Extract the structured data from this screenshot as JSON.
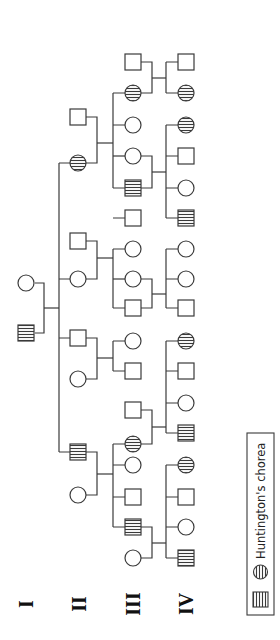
{
  "diagram": {
    "type": "pedigree",
    "orientation": "rotated-90-ccw",
    "generations": [
      {
        "label": "I"
      },
      {
        "label": "II"
      },
      {
        "label": "III"
      },
      {
        "label": "IV"
      }
    ],
    "legend": {
      "label": "Huntington's chorea",
      "symbols": [
        "affected-male-square-striped",
        "affected-female-circle-striped"
      ]
    },
    "colors": {
      "line": "#3a3a3a",
      "background": "#ffffff"
    },
    "individuals": {
      "I": [
        {
          "sex": "female",
          "affected": false,
          "y": 283
        },
        {
          "sex": "male",
          "affected": true,
          "y": 333
        }
      ],
      "II": [
        {
          "sex": "male",
          "affected": false,
          "y": 117,
          "role": "spouse"
        },
        {
          "sex": "female",
          "affected": true,
          "y": 163
        },
        {
          "sex": "male",
          "affected": false,
          "y": 241,
          "role": "spouse"
        },
        {
          "sex": "female",
          "affected": false,
          "y": 279
        },
        {
          "sex": "male",
          "affected": false,
          "y": 338
        },
        {
          "sex": "female",
          "affected": false,
          "y": 379,
          "role": "spouse"
        },
        {
          "sex": "male",
          "affected": true,
          "y": 452
        },
        {
          "sex": "female",
          "affected": false,
          "y": 495,
          "role": "spouse"
        }
      ],
      "III": [
        {
          "sex": "male",
          "affected": false,
          "y": 62,
          "role": "spouse"
        },
        {
          "sex": "female",
          "affected": true,
          "y": 93
        },
        {
          "sex": "female",
          "affected": false,
          "y": 125
        },
        {
          "sex": "female",
          "affected": false,
          "y": 156
        },
        {
          "sex": "male",
          "affected": true,
          "y": 188
        },
        {
          "sex": "male",
          "affected": false,
          "y": 218
        },
        {
          "sex": "female",
          "affected": false,
          "y": 249
        },
        {
          "sex": "female",
          "affected": false,
          "y": 279
        },
        {
          "sex": "male",
          "affected": false,
          "y": 308
        },
        {
          "sex": "female",
          "affected": false,
          "y": 341
        },
        {
          "sex": "male",
          "affected": false,
          "y": 371
        },
        {
          "sex": "male",
          "affected": false,
          "y": 410,
          "role": "spouse"
        },
        {
          "sex": "female",
          "affected": true,
          "y": 444
        },
        {
          "sex": "female",
          "affected": false,
          "y": 465
        },
        {
          "sex": "male",
          "affected": false,
          "y": 497
        },
        {
          "sex": "male",
          "affected": true,
          "y": 527
        },
        {
          "sex": "female",
          "affected": false,
          "y": 558,
          "role": "spouse"
        }
      ],
      "IV": [
        {
          "sex": "male",
          "affected": false,
          "y": 62
        },
        {
          "sex": "female",
          "affected": true,
          "y": 93
        },
        {
          "sex": "female",
          "affected": true,
          "y": 125
        },
        {
          "sex": "male",
          "affected": false,
          "y": 156
        },
        {
          "sex": "female",
          "affected": false,
          "y": 188
        },
        {
          "sex": "male",
          "affected": true,
          "y": 218
        },
        {
          "sex": "female",
          "affected": false,
          "y": 249
        },
        {
          "sex": "female",
          "affected": false,
          "y": 279
        },
        {
          "sex": "male",
          "affected": false,
          "y": 308
        },
        {
          "sex": "female",
          "affected": true,
          "y": 341
        },
        {
          "sex": "male",
          "affected": false,
          "y": 371
        },
        {
          "sex": "female",
          "affected": false,
          "y": 403
        },
        {
          "sex": "male",
          "affected": true,
          "y": 433
        },
        {
          "sex": "female",
          "affected": true,
          "y": 465
        },
        {
          "sex": "male",
          "affected": false,
          "y": 497
        },
        {
          "sex": "female",
          "affected": false,
          "y": 527
        },
        {
          "sex": "male",
          "affected": true,
          "y": 558
        }
      ]
    }
  }
}
